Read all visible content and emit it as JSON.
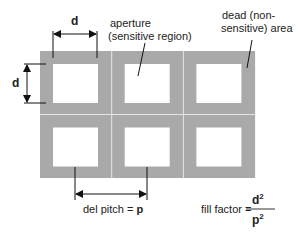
{
  "diagram": {
    "grid": {
      "rows": 2,
      "cols": 3
    },
    "colors": {
      "dead_area": "#a9a9a9",
      "aperture": "#ffffff",
      "divider": "#e6e6e6",
      "ink": "#1a1a1a"
    },
    "labels": {
      "d_top": "d",
      "d_left": "d",
      "aperture_line1": "aperture",
      "aperture_line2": "(sensitive region)",
      "dead_line1": "dead (non-",
      "dead_line2": "sensitive) area",
      "pitch_text": "del pitch = ",
      "pitch_symbol": "p",
      "fill_factor_text": "fill factor = ",
      "fill_numerator": "d",
      "fill_denominator": "p",
      "exponent": "2"
    }
  }
}
